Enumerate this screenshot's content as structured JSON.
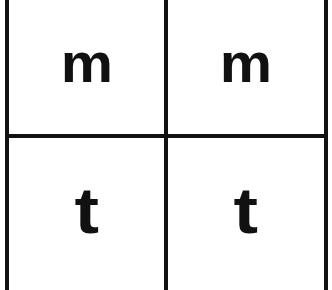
{
  "grid": {
    "rows": 2,
    "columns": 2,
    "line_color": "#111111",
    "background": "#ffffff",
    "cells": [
      {
        "row": 0,
        "col": 0,
        "letter": "m"
      },
      {
        "row": 0,
        "col": 1,
        "letter": "m"
      },
      {
        "row": 1,
        "col": 0,
        "letter": "t"
      },
      {
        "row": 1,
        "col": 1,
        "letter": "t"
      }
    ]
  }
}
